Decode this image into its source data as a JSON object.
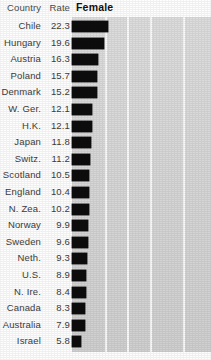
{
  "headers": {
    "country": "Country",
    "rate": "Rate",
    "series": "Female"
  },
  "colors": {
    "bar": "#0d0d0d",
    "panel": "#d9d9d9",
    "gridline": "#fbfbfb",
    "text": "#3d3d3d",
    "background": "#ffffff"
  },
  "chart_data": {
    "type": "bar",
    "orientation": "horizontal",
    "title": "Female",
    "xlabel": "",
    "ylabel": "",
    "xlim": [
      0,
      40
    ],
    "grid": true,
    "gridline_values": [
      20,
      30,
      40,
      60
    ],
    "legend": "none",
    "categories": [
      "Chile",
      "Hungary",
      "Austria",
      "Poland",
      "Denmark",
      "W. Ger.",
      "H.K.",
      "Japan",
      "Switz.",
      "Scotland",
      "England",
      "N. Zea.",
      "Norway",
      "Sweden",
      "Neth.",
      "U.S.",
      "N. Ire.",
      "Canada",
      "Australia",
      "Israel"
    ],
    "values": [
      22.3,
      19.6,
      16.3,
      15.7,
      15.2,
      12.1,
      12.1,
      11.8,
      11.2,
      10.5,
      10.4,
      10.2,
      9.9,
      9.6,
      9.3,
      8.9,
      8.4,
      8.3,
      7.9,
      5.8
    ],
    "series": [
      {
        "name": "Female",
        "values": [
          22.3,
          19.6,
          16.3,
          15.7,
          15.2,
          12.1,
          12.1,
          11.8,
          11.2,
          10.5,
          10.4,
          10.2,
          9.9,
          9.6,
          9.3,
          8.9,
          8.4,
          8.3,
          7.9,
          5.8
        ]
      }
    ]
  },
  "rows": [
    {
      "country": "Chile",
      "rate": "22.3",
      "value": 22.3
    },
    {
      "country": "Hungary",
      "rate": "19.6",
      "value": 19.6
    },
    {
      "country": "Austria",
      "rate": "16.3",
      "value": 16.3
    },
    {
      "country": "Poland",
      "rate": "15.7",
      "value": 15.7
    },
    {
      "country": "Denmark",
      "rate": "15.2",
      "value": 15.2
    },
    {
      "country": "W. Ger.",
      "rate": "12.1",
      "value": 12.1
    },
    {
      "country": "H.K.",
      "rate": "12.1",
      "value": 12.1
    },
    {
      "country": "Japan",
      "rate": "11.8",
      "value": 11.8
    },
    {
      "country": "Switz.",
      "rate": "11.2",
      "value": 11.2
    },
    {
      "country": "Scotland",
      "rate": "10.5",
      "value": 10.5
    },
    {
      "country": "England",
      "rate": "10.4",
      "value": 10.4
    },
    {
      "country": "N. Zea.",
      "rate": "10.2",
      "value": 10.2
    },
    {
      "country": "Norway",
      "rate": "9.9",
      "value": 9.9
    },
    {
      "country": "Sweden",
      "rate": "9.6",
      "value": 9.6
    },
    {
      "country": "Neth.",
      "rate": "9.3",
      "value": 9.3
    },
    {
      "country": "U.S.",
      "rate": "8.9",
      "value": 8.9
    },
    {
      "country": "N. Ire.",
      "rate": "8.4",
      "value": 8.4
    },
    {
      "country": "Canada",
      "rate": "8.3",
      "value": 8.3
    },
    {
      "country": "Australia",
      "rate": "7.9",
      "value": 7.9
    },
    {
      "country": "Israel",
      "rate": "5.8",
      "value": 5.8
    }
  ]
}
